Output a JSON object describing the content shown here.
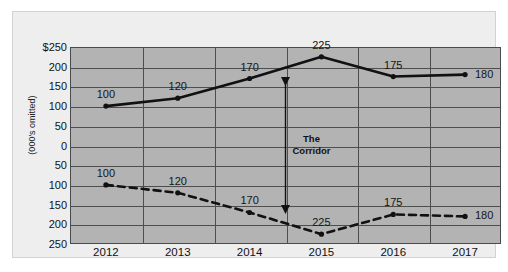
{
  "chart_data": {
    "type": "line",
    "title": "",
    "subtitle": "",
    "xlabel": "",
    "ylabel": "(000's omitted)",
    "grid": true,
    "legend": false,
    "categories": [
      "2012",
      "2013",
      "2014",
      "2015",
      "2016",
      "2017"
    ],
    "ytick_labels": [
      "$250",
      "200",
      "150",
      "100",
      "50",
      "0",
      "50",
      "100",
      "150",
      "200",
      "250"
    ],
    "ytick_values": [
      250,
      200,
      150,
      100,
      50,
      0,
      -50,
      -100,
      -150,
      -200,
      -250
    ],
    "ylim": [
      -250,
      250
    ],
    "axis_note": "Y axis is mirrored about zero: values above zero read 0-250, values below zero are labelled as positive magnitudes 50-250 increasing downward.",
    "series": [
      {
        "name": "upper-line",
        "style": "solid",
        "color": "#111111",
        "markers": true,
        "values": [
          100,
          120,
          170,
          225,
          175,
          180
        ],
        "labels": [
          "100",
          "120",
          "170",
          "225",
          "175",
          "180"
        ]
      },
      {
        "name": "lower-line",
        "style": "dashed",
        "color": "#111111",
        "markers": true,
        "values": [
          -100,
          -120,
          -170,
          -225,
          -175,
          -180
        ],
        "labels": [
          "100",
          "120",
          "170",
          "225",
          "175",
          "180"
        ]
      }
    ],
    "annotations": [
      {
        "name": "corridor",
        "text_line1": "The",
        "text_line2": "Corridor",
        "type": "double-headed-arrow",
        "x_category_position": 2.5,
        "y_from": 170,
        "y_to": -170
      }
    ],
    "colors": {
      "plot_background": "#b3b3b3",
      "card_background": "#eeeeee",
      "grid": "#4e4e4e",
      "axis": "#4a4a4a",
      "series": "#111111",
      "page_background": "#ffffff"
    }
  }
}
